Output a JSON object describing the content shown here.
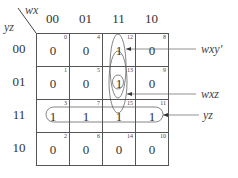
{
  "kmap": {
    "col_var": "wx",
    "row_var": "yz",
    "col_headers": [
      "00",
      "01",
      "11",
      "10"
    ],
    "row_headers": [
      "00",
      "01",
      "11",
      "10"
    ],
    "cells": [
      [
        {
          "value": "0",
          "index": "0"
        },
        {
          "value": "0",
          "index": "4"
        },
        {
          "value": "1",
          "index": "12"
        },
        {
          "value": "0",
          "index": "8"
        }
      ],
      [
        {
          "value": "0",
          "index": "1"
        },
        {
          "value": "0",
          "index": "5"
        },
        {
          "value": "1",
          "index": "13"
        },
        {
          "value": "0",
          "index": "9"
        }
      ],
      [
        {
          "value": "1",
          "index": "3"
        },
        {
          "value": "1",
          "index": "7"
        },
        {
          "value": "1",
          "index": "15"
        },
        {
          "value": "1",
          "index": "11"
        }
      ],
      [
        {
          "value": "0",
          "index": "2"
        },
        {
          "value": "0",
          "index": "6"
        },
        {
          "value": "0",
          "index": "14"
        },
        {
          "value": "0",
          "index": "10"
        }
      ]
    ],
    "groups": [
      {
        "label": "wxy'",
        "cells": [
          12,
          13
        ]
      },
      {
        "label": "wxz",
        "cells": [
          13,
          15
        ]
      },
      {
        "label": "yz",
        "cells": [
          3,
          7,
          15,
          11
        ]
      }
    ]
  }
}
